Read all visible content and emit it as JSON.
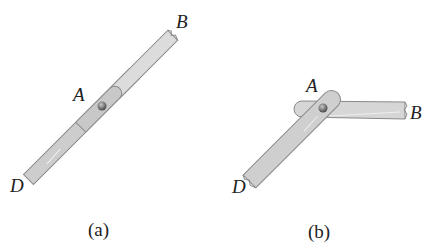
{
  "figure_a": {
    "caption": "(a)",
    "labels": {
      "A": "A",
      "B": "B",
      "D": "D"
    },
    "description": "Single straight bar DB pinned at A"
  },
  "figure_b": {
    "caption": "(b)",
    "labels": {
      "A": "A",
      "B": "B",
      "D": "D"
    },
    "description": "Two bars DA and AB pinned at A forming an angle"
  },
  "colors": {
    "bar_fill": "#d4d4d4",
    "bar_fill_dark": "#c4c4c4",
    "bar_edge": "#8a8a8a",
    "pin": "#7a7a7a",
    "text": "#222222"
  }
}
